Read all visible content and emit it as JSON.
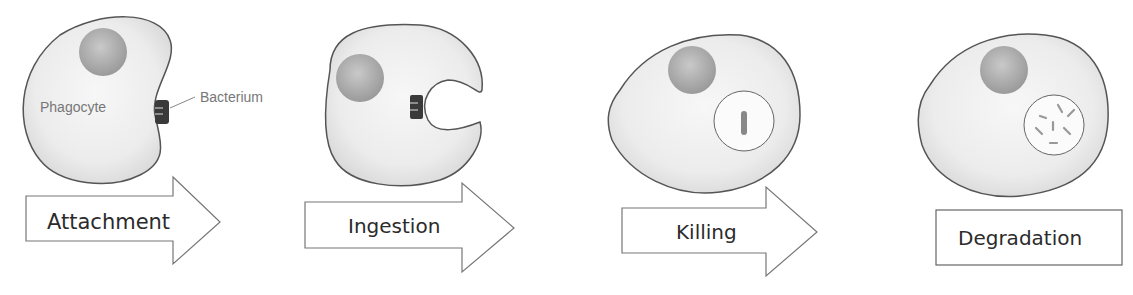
{
  "labels": {
    "phagocyte": "Phagocyte",
    "bacterium": "Bacterium"
  },
  "stages": [
    {
      "name": "Attachment"
    },
    {
      "name": "Ingestion"
    },
    {
      "name": "Killing"
    },
    {
      "name": "Degradation"
    }
  ],
  "colors": {
    "cell_fill": "#e6e6e6",
    "cell_stroke": "#555555",
    "nucleus": "#a8a8a8",
    "bacterium": "#3a3a3a",
    "arrow_stroke": "#777777",
    "text": "#2b2b2b"
  }
}
